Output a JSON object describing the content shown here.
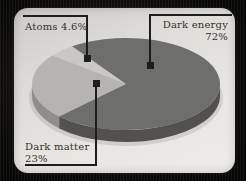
{
  "chart_data": {
    "type": "pie",
    "style": "3d-perspective",
    "unit": "%",
    "title": "",
    "labels_style": "callout",
    "start_angle_deg": 125,
    "slices": [
      {
        "label": "Atoms",
        "value": 4.6,
        "display": "Atoms 4.6%",
        "color_top": "#c9c8c4",
        "color_side": "#a3a29f"
      },
      {
        "label": "Dark matter",
        "value": 23,
        "display": "Dark matter 23%",
        "color_top": "#b5b4b0",
        "color_side": "#8f8e8b"
      },
      {
        "label": "Dark energy",
        "value": 72,
        "display": "Dark energy 72%",
        "color_top": "#6e6e6c",
        "color_side": "#525150"
      }
    ]
  },
  "labels": {
    "atoms": "Atoms 4.6%",
    "dark_energy": [
      "Dark energy",
      "72%"
    ],
    "dark_matter": [
      "Dark matter",
      "23%"
    ]
  },
  "colors": {
    "background": "#0b0a09",
    "card": "#e6e4e0",
    "callout_line": "#1f1d1b",
    "marker": "#1f1d1b",
    "text": "#33312d",
    "pie_shadow": "rgba(0,0,0,0.10)"
  }
}
